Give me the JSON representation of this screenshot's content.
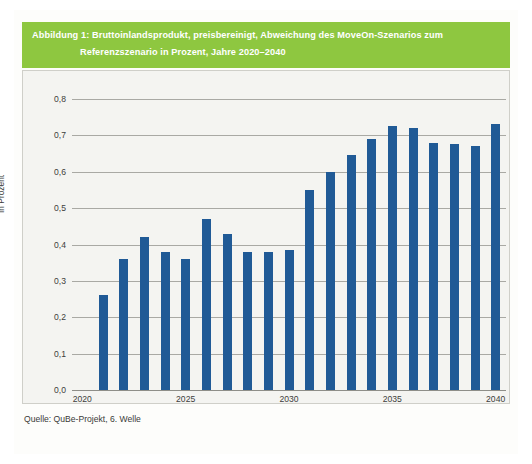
{
  "figure": {
    "title_line1": "Abbildung 1: Bruttoinlandsprodukt, preisbereinigt, Abweichung des MoveOn-Szenarios zum",
    "title_line2": "Referenzszenario in Prozent, Jahre 2020–2040",
    "source": "Quelle: QuBe-Projekt, 6. Welle",
    "band_color": "#8ec740",
    "bar_color": "#205a96",
    "panel_color": "#f4f4f1"
  },
  "chart_data": {
    "type": "bar",
    "title": "Abbildung 1: Bruttoinlandsprodukt, preisbereinigt, Abweichung des MoveOn-Szenarios zum Referenzszenario in Prozent, Jahre 2020–2040",
    "xlabel": "",
    "ylabel": "In Prozent",
    "ylim": [
      0.0,
      0.8
    ],
    "ytick_labels": [
      "0,0",
      "0,1",
      "0,2",
      "0,3",
      "0,4",
      "0,5",
      "0,6",
      "0,7",
      "0,8"
    ],
    "ytick_values": [
      0.0,
      0.1,
      0.2,
      0.3,
      0.4,
      0.5,
      0.6,
      0.7,
      0.8
    ],
    "xtick_labels": [
      "2020",
      "2025",
      "2030",
      "2035",
      "2040"
    ],
    "xtick_values": [
      2020,
      2025,
      2030,
      2035,
      2040
    ],
    "grid": true,
    "legend": false,
    "categories": [
      "2020",
      "2021",
      "2022",
      "2023",
      "2024",
      "2025",
      "2026",
      "2027",
      "2028",
      "2029",
      "2030",
      "2031",
      "2032",
      "2033",
      "2034",
      "2035",
      "2036",
      "2037",
      "2038",
      "2039",
      "2040"
    ],
    "values": [
      0.0,
      0.26,
      0.36,
      0.42,
      0.38,
      0.36,
      0.47,
      0.43,
      0.38,
      0.38,
      0.385,
      0.55,
      0.6,
      0.645,
      0.69,
      0.725,
      0.72,
      0.68,
      0.675,
      0.67,
      0.73
    ],
    "series": [
      {
        "name": "Abweichung MoveOn zum Referenzszenario",
        "values": [
          0.0,
          0.26,
          0.36,
          0.42,
          0.38,
          0.36,
          0.47,
          0.43,
          0.38,
          0.38,
          0.385,
          0.55,
          0.6,
          0.645,
          0.69,
          0.725,
          0.72,
          0.68,
          0.675,
          0.67,
          0.73
        ]
      }
    ]
  }
}
